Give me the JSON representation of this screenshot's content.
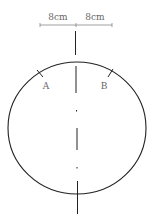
{
  "diagram": {
    "ruler": {
      "left_label": "8cm",
      "right_label": "8cm"
    },
    "points": [
      {
        "label": "A"
      },
      {
        "label": "B"
      }
    ],
    "colors": {
      "stroke": "#222222",
      "ruler": "#777777",
      "text": "#666666"
    }
  }
}
